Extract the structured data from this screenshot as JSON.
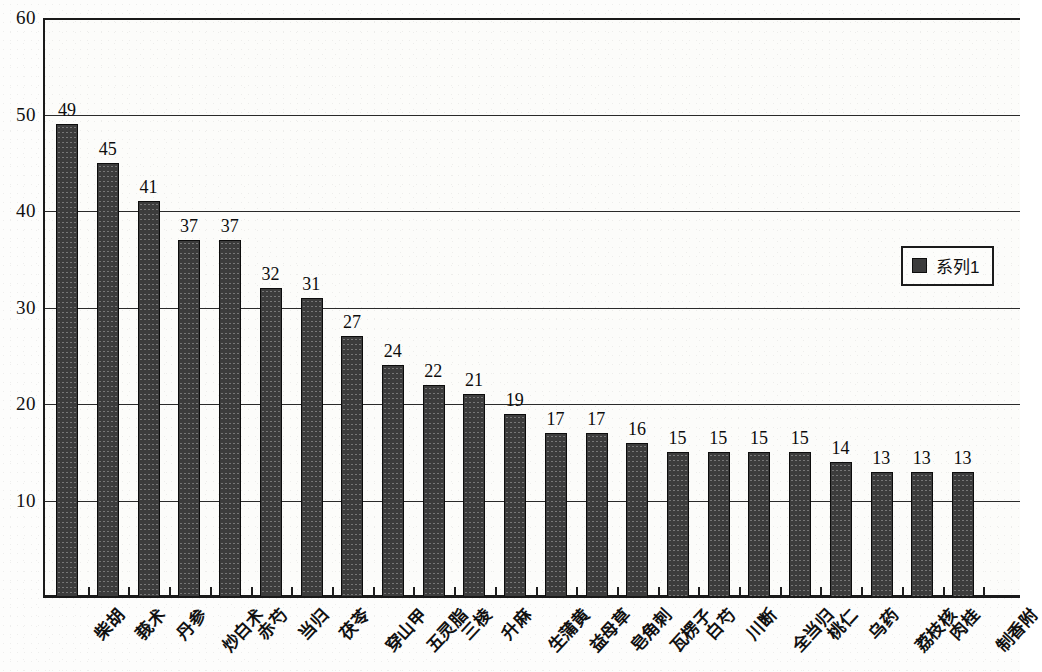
{
  "chart_data": {
    "type": "bar",
    "title": "",
    "xlabel": "",
    "ylabel": "",
    "ylim": [
      0,
      60
    ],
    "yticks": [
      10,
      20,
      30,
      40,
      50,
      60
    ],
    "grid": true,
    "legend_position": "right",
    "series": [
      {
        "name": "系列1",
        "color": "#3c3c3c",
        "values": [
          49,
          45,
          41,
          37,
          37,
          32,
          31,
          27,
          24,
          22,
          21,
          19,
          17,
          17,
          16,
          15,
          15,
          15,
          15,
          14,
          13,
          13,
          13
        ]
      }
    ],
    "categories": [
      "柴胡",
      "莪术",
      "丹参",
      "炒白术",
      "赤芍",
      "当归",
      "茯苓",
      "穿山甲",
      "五灵脂",
      "三棱",
      "升麻",
      "生蒲黄",
      "益母草",
      "皂角刺",
      "瓦楞子",
      "白芍",
      "川断",
      "全当归",
      "桃仁",
      "乌药",
      "荔枝核",
      "肉桂",
      "制香附"
    ],
    "data_labels": [
      "49",
      "45",
      "41",
      "37",
      "37",
      "32",
      "31",
      "27",
      "24",
      "22",
      "21",
      "19",
      "17",
      "17",
      "16",
      "15",
      "15",
      "15",
      "15",
      "14",
      "13",
      "13",
      "13"
    ]
  },
  "legend": {
    "entries": [
      {
        "label": "系列1",
        "swatch": "#3c3c3c"
      }
    ]
  },
  "axis": {
    "y_tick_labels": [
      "60",
      "50",
      "40",
      "30",
      "20",
      "10"
    ]
  }
}
